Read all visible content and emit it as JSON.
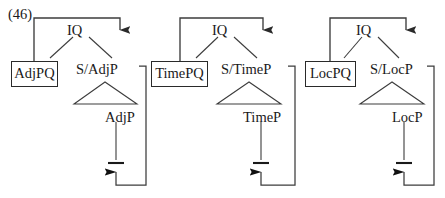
{
  "figure": {
    "example_number": "(46)",
    "caption": "",
    "line_color": "#3c3c3c",
    "text_color": "#1a1a1a",
    "background": "#ffffff"
  },
  "trees": [
    {
      "id": "adjp-tree",
      "root_label": "IQ",
      "boxed_node": {
        "base": "AdjP",
        "subscript": "Q"
      },
      "slash_label": "S/AdjP",
      "triangle_label": "AdjP",
      "trace_label": "",
      "movement": "filler-to-gap"
    },
    {
      "id": "timep-tree",
      "root_label": "IQ",
      "boxed_node": {
        "base": "TimeP",
        "subscript": "Q"
      },
      "slash_label": "S/TimeP",
      "triangle_label": "TimeP",
      "trace_label": "",
      "movement": "filler-to-gap"
    },
    {
      "id": "locp-tree",
      "root_label": "IQ",
      "boxed_node": {
        "base": "LocP",
        "subscript": "Q"
      },
      "slash_label": "S/LocP",
      "triangle_label": "LocP",
      "trace_label": "",
      "movement": "filler-to-gap"
    }
  ]
}
